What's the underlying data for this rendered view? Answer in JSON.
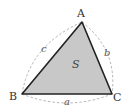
{
  "diagram": {
    "vertices": [
      {
        "id": "A",
        "label": "A"
      },
      {
        "id": "B",
        "label": "B"
      },
      {
        "id": "C",
        "label": "C"
      }
    ],
    "sides": [
      {
        "id": "a",
        "label": "a",
        "between": [
          "B",
          "C"
        ]
      },
      {
        "id": "b",
        "label": "b",
        "between": [
          "A",
          "C"
        ]
      },
      {
        "id": "c",
        "label": "c",
        "between": [
          "A",
          "B"
        ]
      }
    ],
    "area_label": "S",
    "colors": {
      "fill": "#c8c8c8",
      "edge": "#222222",
      "arc": "#aaaaaa"
    }
  }
}
